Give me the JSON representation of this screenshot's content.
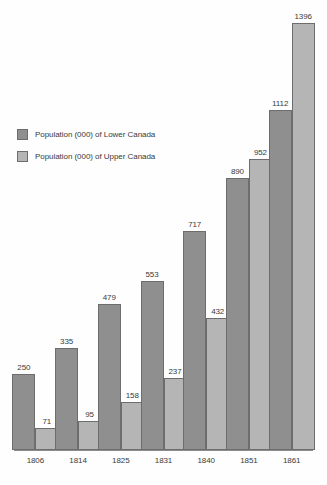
{
  "chart_data": {
    "type": "bar",
    "title": "",
    "subtitle": "",
    "xlabel": "",
    "ylabel": "",
    "grid": false,
    "legend_position": "upper-left",
    "ylim": [
      0,
      1450
    ],
    "categories": [
      "1806",
      "1814",
      "1825",
      "1831",
      "1840",
      "1851",
      "1861"
    ],
    "series": [
      {
        "name": "Population (000) of Lower Canada",
        "color": "#8f8f8f",
        "values": [
          250,
          335,
          479,
          553,
          717,
          890,
          1112
        ]
      },
      {
        "name": "Population (000) of Upper Canada",
        "color": "#b5b5b5",
        "values": [
          71,
          95,
          158,
          237,
          432,
          952,
          1396
        ]
      }
    ]
  },
  "legend": {
    "items": [
      {
        "label": "Population (000) of Lower Canada"
      },
      {
        "label": "Population (000) of Upper Canada"
      }
    ]
  }
}
